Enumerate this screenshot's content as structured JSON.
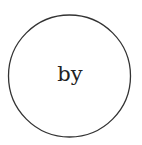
{
  "diagram": {
    "node": {
      "shape": "circle",
      "label": "by",
      "stroke_color": "#333333",
      "fill_color": "#ffffff"
    }
  }
}
